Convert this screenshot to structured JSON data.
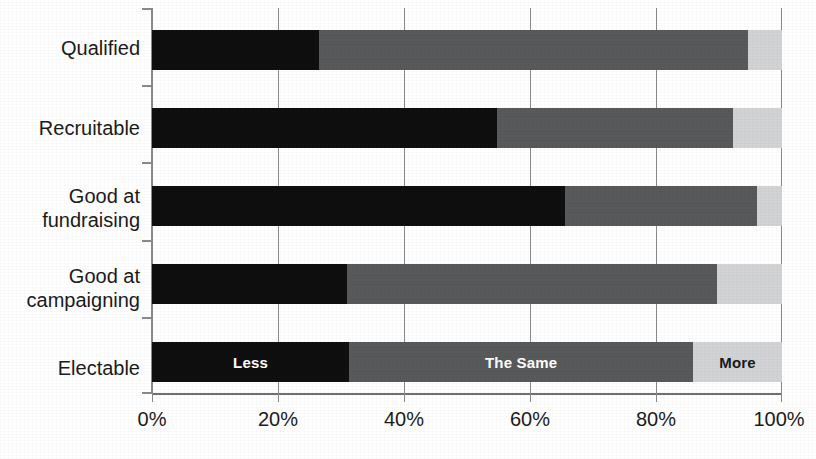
{
  "chart_data": {
    "type": "bar",
    "orientation": "horizontal",
    "stacked": true,
    "normalized_percent": true,
    "title": "",
    "subtitle": "",
    "xlabel": "",
    "ylabel": "",
    "xlim": [
      0,
      100
    ],
    "xticks": [
      0,
      20,
      40,
      60,
      80,
      100
    ],
    "xtick_labels": [
      "0%",
      "20%",
      "40%",
      "60%",
      "80%",
      "100%"
    ],
    "grid": "vertical",
    "legend_position": "in-bars-bottom-row",
    "categories": [
      "Qualified",
      "Recruitable",
      "Good at\nfundraising",
      "Good at\ncampaigning",
      "Electable"
    ],
    "series": [
      {
        "name": "Less",
        "color": "#100f0f",
        "values": [
          26.5,
          54.8,
          65.6,
          31.0,
          31.3
        ]
      },
      {
        "name": "The Same",
        "color": "#58595b",
        "values": [
          68.1,
          37.4,
          30.4,
          58.7,
          54.6
        ]
      },
      {
        "name": "More",
        "color": "#d2d3d5",
        "values": [
          5.4,
          7.8,
          4.0,
          10.3,
          14.1
        ]
      }
    ],
    "in_bar_labels": {
      "row": "Electable",
      "labels": [
        "Less",
        "The Same",
        "More"
      ]
    }
  },
  "axis": {
    "x_tick_labels": [
      "0%",
      "20%",
      "40%",
      "60%",
      "80%",
      "100%"
    ]
  },
  "legend": {
    "items": [
      {
        "label": "Less",
        "color": "#100f0f",
        "text_color": "#ffffff"
      },
      {
        "label": "The Same",
        "color": "#58595b",
        "text_color": "#ffffff"
      },
      {
        "label": "More",
        "color": "#d2d3d5",
        "text_color": "#1a1a1a"
      }
    ]
  },
  "categories": {
    "qualified": "Qualified",
    "recruitable": "Recruitable",
    "fundraising": "Good at\nfundraising",
    "campaigning": "Good at\ncampaigning",
    "electable": "Electable"
  }
}
